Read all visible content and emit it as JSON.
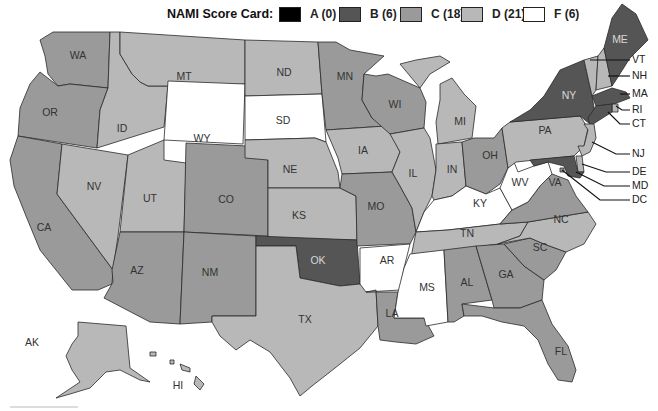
{
  "legend": {
    "title": "NAMI Score Card:",
    "items": [
      {
        "grade": "A",
        "label": "A (0)",
        "count": 0,
        "color": "#000000"
      },
      {
        "grade": "B",
        "label": "B (6)",
        "count": 6,
        "color": "#555555"
      },
      {
        "grade": "C",
        "label": "C (18)",
        "count": 18,
        "color": "#9a9a9a"
      },
      {
        "grade": "D",
        "label": "D (21)",
        "count": 21,
        "color": "#b8b8b8"
      },
      {
        "grade": "F",
        "label": "F (6)",
        "count": 6,
        "color": "#ffffff"
      }
    ]
  },
  "states": {
    "WA": "C",
    "OR": "C",
    "CA": "C",
    "ID": "D",
    "NV": "D",
    "MT": "D",
    "WY": "F",
    "UT": "D",
    "CO": "C",
    "AZ": "C",
    "NM": "C",
    "ND": "D",
    "SD": "F",
    "NE": "D",
    "KS": "D",
    "OK": "B",
    "TX": "D",
    "MN": "C",
    "IA": "D",
    "MO": "C",
    "AR": "F",
    "LA": "C",
    "WI": "C",
    "IL": "D",
    "MI": "D",
    "IN": "D",
    "OH": "C",
    "KY": "F",
    "TN": "D",
    "MS": "F",
    "AL": "C",
    "GA": "C",
    "FL": "C",
    "SC": "C",
    "NC": "D",
    "VA": "C",
    "WV": "F",
    "PA": "D",
    "NY": "B",
    "VT": "D",
    "NH": "D",
    "ME": "B",
    "MA": "B",
    "RI": "D",
    "CT": "B",
    "NJ": "D",
    "DE": "D",
    "MD": "B",
    "DC": "C",
    "AK": "D",
    "HI": "D"
  },
  "labels": {
    "WA": "WA",
    "OR": "OR",
    "CA": "CA",
    "ID": "ID",
    "NV": "NV",
    "MT": "MT",
    "WY": "WY",
    "UT": "UT",
    "CO": "CO",
    "AZ": "AZ",
    "NM": "NM",
    "ND": "ND",
    "SD": "SD",
    "NE": "NE",
    "KS": "KS",
    "OK": "OK",
    "TX": "TX",
    "MN": "MN",
    "IA": "IA",
    "MO": "MO",
    "AR": "AR",
    "LA": "LA",
    "WI": "WI",
    "IL": "IL",
    "MI": "MI",
    "IN": "IN",
    "OH": "OH",
    "KY": "KY",
    "TN": "TN",
    "MS": "MS",
    "AL": "AL",
    "GA": "GA",
    "FL": "FL",
    "SC": "SC",
    "NC": "NC",
    "VA": "VA",
    "WV": "WV",
    "PA": "PA",
    "NY": "NY",
    "ME": "ME",
    "AK": "AK",
    "HI": "HI"
  },
  "callouts": {
    "VT": "VT",
    "NH": "NH",
    "MA": "MA",
    "RI": "RI",
    "CT": "CT",
    "NJ": "NJ",
    "DE": "DE",
    "MD": "MD",
    "DC": "DC"
  }
}
